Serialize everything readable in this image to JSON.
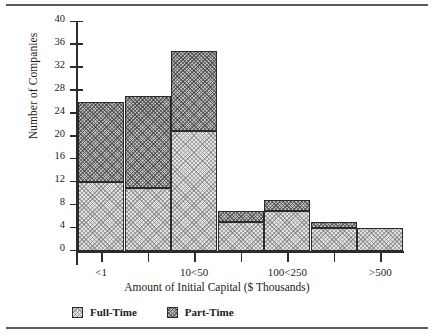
{
  "chart_data": {
    "type": "bar",
    "subtype": "stacked-bar",
    "title": "",
    "xlabel": "Amount of Initial Capital ($ Thousands)",
    "ylabel": "Number of Companies",
    "categories": [
      "<1",
      "1<5",
      "10<50",
      "50<100",
      "100<250",
      "250<500",
      ">500"
    ],
    "tick_labels": [
      "<1",
      "",
      "10<50",
      "",
      "100<250",
      "",
      ">500"
    ],
    "series": [
      {
        "name": "Full-Time",
        "values": [
          12,
          11,
          21,
          5,
          7,
          4,
          4
        ],
        "color": "#e3e3e3"
      },
      {
        "name": "Part-Time",
        "values": [
          14,
          16,
          14,
          2,
          2,
          1,
          0
        ],
        "color": "#b9b9b9"
      }
    ],
    "totals": [
      26,
      27,
      35,
      7,
      9,
      5,
      4
    ],
    "ylim": [
      0,
      40
    ],
    "yticks": [
      0,
      4,
      8,
      12,
      16,
      20,
      24,
      28,
      32,
      36,
      40
    ],
    "ytick_labels": [
      "0",
      "4",
      "8",
      "12",
      "16",
      "20",
      "24",
      "28",
      "32",
      "36",
      "40"
    ],
    "grid": false,
    "legend_position": "below-axis-left"
  },
  "legend": {
    "items": [
      {
        "label": "Full-Time",
        "swatch": "full-time-swatch"
      },
      {
        "label": "Part-Time",
        "swatch": "part-time-swatch"
      }
    ]
  }
}
